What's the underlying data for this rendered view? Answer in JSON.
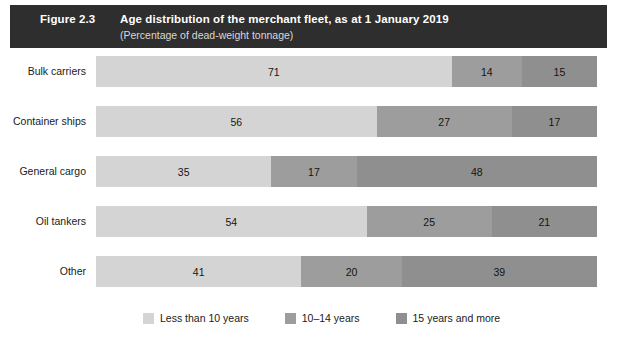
{
  "header": {
    "figure_number": "Figure 2.3",
    "title": "Age distribution of the merchant fleet, as at 1 January 2019",
    "subtitle": "(Percentage of dead-weight tonnage)",
    "band_color": "#2e2e2e"
  },
  "legend": {
    "items": [
      {
        "label": "Less than 10 years",
        "color": "#d4d4d4",
        "swatch_name": "legend-swatch-less-than-10-years"
      },
      {
        "label": "10–14 years",
        "color": "#9d9d9d",
        "swatch_name": "legend-swatch-10-14-years"
      },
      {
        "label": "15 years and more",
        "color": "#8f8f8f",
        "swatch_name": "legend-swatch-15-years-and-more"
      }
    ]
  },
  "chart_data": {
    "type": "bar",
    "orientation": "horizontal",
    "stacked": true,
    "stacked_mode": "percent",
    "title": "Age distribution of the merchant fleet, as at 1 January 2019",
    "subtitle": "(Percentage of dead-weight tonnage)",
    "xlabel": "",
    "ylabel": "",
    "xlim": [
      0,
      100
    ],
    "grid": false,
    "legend_position": "bottom",
    "categories": [
      "Bulk carriers",
      "Container ships",
      "General cargo",
      "Oil tankers",
      "Other"
    ],
    "series": [
      {
        "name": "Less than 10 years",
        "color": "#d4d4d4",
        "values": [
          71,
          56,
          35,
          54,
          41
        ]
      },
      {
        "name": "10–14 years",
        "color": "#9d9d9d",
        "values": [
          14,
          27,
          17,
          25,
          20
        ]
      },
      {
        "name": "15 years and more",
        "color": "#8f8f8f",
        "values": [
          15,
          17,
          48,
          21,
          39
        ]
      }
    ],
    "rows": [
      {
        "label": "Bulk carriers",
        "segments": [
          {
            "series": "Less than 10 years",
            "value": 71,
            "label": "71",
            "color": "#d4d4d4"
          },
          {
            "series": "10–14 years",
            "value": 14,
            "label": "14",
            "color": "#9d9d9d"
          },
          {
            "series": "15 years and more",
            "value": 15,
            "label": "15",
            "color": "#8f8f8f"
          }
        ]
      },
      {
        "label": "Container ships",
        "segments": [
          {
            "series": "Less than 10 years",
            "value": 56,
            "label": "56",
            "color": "#d4d4d4"
          },
          {
            "series": "10–14 years",
            "value": 27,
            "label": "27",
            "color": "#9d9d9d"
          },
          {
            "series": "15 years and more",
            "value": 17,
            "label": "17",
            "color": "#8f8f8f"
          }
        ]
      },
      {
        "label": "General cargo",
        "segments": [
          {
            "series": "Less than 10 years",
            "value": 35,
            "label": "35",
            "color": "#d4d4d4"
          },
          {
            "series": "10–14 years",
            "value": 17,
            "label": "17",
            "color": "#9d9d9d"
          },
          {
            "series": "15 years and more",
            "value": 48,
            "label": "48",
            "color": "#8f8f8f"
          }
        ]
      },
      {
        "label": "Oil tankers",
        "segments": [
          {
            "series": "Less than 10 years",
            "value": 54,
            "label": "54",
            "color": "#d4d4d4"
          },
          {
            "series": "10–14 years",
            "value": 25,
            "label": "25",
            "color": "#9d9d9d"
          },
          {
            "series": "15 years and more",
            "value": 21,
            "label": "21",
            "color": "#8f8f8f"
          }
        ]
      },
      {
        "label": "Other",
        "segments": [
          {
            "series": "Less than 10 years",
            "value": 41,
            "label": "41",
            "color": "#d4d4d4"
          },
          {
            "series": "10–14 years",
            "value": 20,
            "label": "20",
            "color": "#9d9d9d"
          },
          {
            "series": "15 years and more",
            "value": 39,
            "label": "39",
            "color": "#8f8f8f"
          }
        ]
      }
    ]
  }
}
